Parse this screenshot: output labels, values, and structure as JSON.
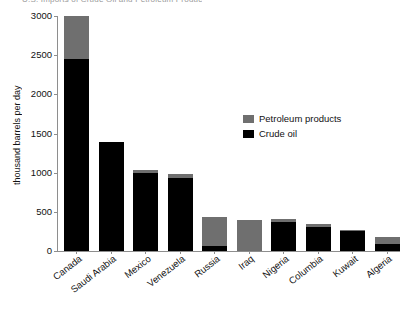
{
  "title_strip": "U.S. Imports of Crude Oil and Petroleum Products",
  "legend": {
    "position": "inside-right",
    "entries": [
      {
        "label": "Petroleum products",
        "color": "#6f6f6f",
        "name": "petroleum-products"
      },
      {
        "label": "Crude oil",
        "color": "#000000",
        "name": "crude-oil"
      }
    ]
  },
  "chart_data": {
    "type": "bar",
    "stacked": true,
    "title": "",
    "xlabel": "",
    "ylabel": "thousand barrels per day",
    "ylim": [
      0,
      3000
    ],
    "yticks": [
      0,
      500,
      1000,
      1500,
      2000,
      2500,
      3000
    ],
    "ytick_labels": [
      "0",
      "500",
      "1000",
      "1500",
      "2000",
      "2500",
      "3000"
    ],
    "grid": false,
    "legend_position": "inside-right",
    "categories": [
      "Canada",
      "Saudi Arabia",
      "Mexico",
      "Venezuela",
      "Russia",
      "Iraq",
      "Nigeria",
      "Columbia",
      "Kuwait",
      "Algeria"
    ],
    "series": [
      {
        "name": "Crude oil",
        "color": "#000000",
        "values": [
          2450,
          1390,
          1000,
          930,
          60,
          0,
          370,
          310,
          250,
          90
        ]
      },
      {
        "name": "Petroleum products",
        "color": "#6f6f6f",
        "values": [
          550,
          0,
          40,
          50,
          370,
          400,
          40,
          40,
          20,
          90
        ]
      }
    ],
    "totals": [
      3000,
      1390,
      1040,
      980,
      430,
      400,
      410,
      350,
      270,
      180
    ]
  },
  "colors": {
    "crude_oil": "#000000",
    "petroleum_products": "#6f6f6f",
    "axis": "#8e8e8e",
    "text": "#111111",
    "background": "#ffffff"
  }
}
